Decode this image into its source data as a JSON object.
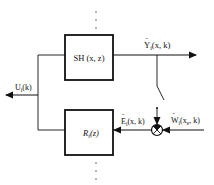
{
  "diagram": {
    "type": "block-diagram",
    "blocks": {
      "sh": {
        "label": "SH (x, z)"
      },
      "r": {
        "label": "R",
        "sub": "i",
        "arg": "(z)"
      }
    },
    "signals": {
      "output": {
        "label": "Y",
        "accent": "˜",
        "sub": "i",
        "arg": "(x, k)"
      },
      "control": {
        "label": "U",
        "sub": "i",
        "arg": "(k)"
      },
      "error": {
        "label": "E",
        "accent": "˜",
        "sub": "i",
        "arg": "(x, k)"
      },
      "reference": {
        "label": "W",
        "accent": "˜",
        "sub": "i",
        "arg": "(x",
        "arg_sub": "e",
        "arg_end": ", k)"
      }
    },
    "elements": [
      "summing-junction",
      "switch",
      "dotted-continuation-top",
      "dotted-continuation-bottom"
    ]
  }
}
